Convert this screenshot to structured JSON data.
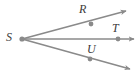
{
  "figure": {
    "type": "geometry-diagram",
    "background_color": "#ffffff",
    "line_color": "#8a8a8a",
    "dot_color": "#8a8a8a",
    "label_color": "#3b3b3b",
    "width": 138,
    "height": 75,
    "vertex": {
      "name": "S",
      "label": "S",
      "x": 22,
      "y": 39
    },
    "points": [
      {
        "name": "R",
        "label": "R",
        "x": 91,
        "y": 24,
        "label_x": 79,
        "label_y": 3
      },
      {
        "name": "T",
        "label": "T",
        "x": 118,
        "y": 39,
        "label_x": 112,
        "label_y": 22
      },
      {
        "name": "U",
        "label": "U",
        "x": 90,
        "y": 59,
        "label_x": 87,
        "label_y": 43
      }
    ],
    "rays": [
      {
        "name": "ray-SR",
        "through": "R",
        "from_x": 22,
        "from_y": 39,
        "to_x": 126,
        "to_y": 11
      },
      {
        "name": "ray-ST",
        "through": "T",
        "from_x": 22,
        "from_y": 39,
        "to_x": 134,
        "to_y": 39
      },
      {
        "name": "ray-SU",
        "through": "U",
        "from_x": 22,
        "from_y": 39,
        "to_x": 130,
        "to_y": 69
      }
    ],
    "labels": {
      "s": "S",
      "r": "R",
      "t": "T",
      "u": "U"
    }
  }
}
